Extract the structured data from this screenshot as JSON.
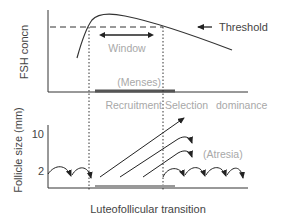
{
  "top_panel": {
    "ylabel": "FSH concn",
    "threshold_label": "Threshold",
    "window_label": "Window",
    "menses_label": "(Menses)"
  },
  "phases": {
    "recruitment": "Recruitment",
    "selection": "Selection",
    "dominance": "dominance"
  },
  "bottom_panel": {
    "ylabel": "Follicle size (mm)",
    "ticks": [
      "10",
      "2"
    ],
    "atresia_label": "(Atresia)",
    "xlabel": "Luteofollicular transition"
  },
  "colors": {
    "line": "#222222",
    "muted_text": "#a8a8a8",
    "text": "#444444",
    "menses_bar": "#555555",
    "bottom_bar": "#999999"
  }
}
